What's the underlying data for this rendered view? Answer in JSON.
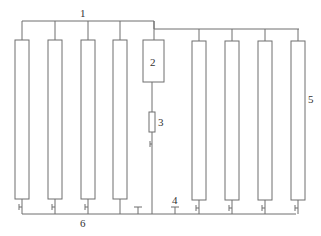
{
  "diagram": {
    "type": "schematic",
    "labels": {
      "top_manifold": "1",
      "central_unit": "2",
      "inline_component": "3",
      "outlet_valve": "4",
      "column": "5",
      "bottom_manifold": "6"
    },
    "columns": {
      "left_count": 4,
      "right_count": 4
    },
    "colors": {
      "line": "#6f6f6f",
      "text": "#333333",
      "background": "#ffffff"
    }
  }
}
